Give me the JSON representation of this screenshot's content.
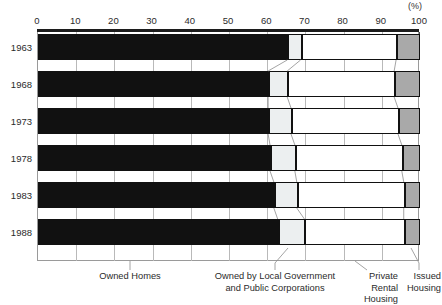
{
  "unit_note": "(%)",
  "axis": {
    "ticks": [
      "0",
      "10",
      "20",
      "30",
      "40",
      "50",
      "60",
      "70",
      "80",
      "90",
      "100"
    ],
    "min": 0,
    "max": 100
  },
  "legend": {
    "owned_homes": "Owned Homes",
    "public_line1": "Owned by Local Government",
    "public_line2": "and Public Corporations",
    "private_line1": "Private Rental",
    "private_line2": "Housing",
    "issued_line1": "Issued",
    "issued_line2": "Housing"
  },
  "years": [
    "1963",
    "1968",
    "1973",
    "1978",
    "1983",
    "1988"
  ],
  "chart_data": {
    "type": "bar",
    "orientation": "horizontal",
    "stacked": true,
    "normalized": true,
    "title": "",
    "xlabel": "",
    "ylabel": "",
    "unit": "(%)",
    "xlim": [
      0,
      100
    ],
    "grid": true,
    "legend_position": "bottom",
    "categories": [
      "1963",
      "1968",
      "1973",
      "1978",
      "1983",
      "1988"
    ],
    "tick_labels": [
      "0",
      "10",
      "20",
      "30",
      "40",
      "50",
      "60",
      "70",
      "80",
      "90",
      "100"
    ],
    "series": [
      {
        "name": "Owned Homes",
        "color": "#111111",
        "values": [
          65.5,
          60.5,
          60.5,
          61.0,
          62.0,
          63.0
        ]
      },
      {
        "name": "Owned by Local Government and Public Corporations",
        "color": "#eceff0",
        "values": [
          3.5,
          5.0,
          6.0,
          6.5,
          6.0,
          7.0
        ]
      },
      {
        "name": "Private Rental Housing",
        "color": "#ffffff",
        "values": [
          25.0,
          28.0,
          28.0,
          28.0,
          28.0,
          26.0
        ]
      },
      {
        "name": "Issued Housing",
        "color": "#a9a9a9",
        "values": [
          6.0,
          6.5,
          5.5,
          4.5,
          4.0,
          4.0
        ]
      }
    ],
    "cumulative_boundaries": [
      [
        65.5,
        69.0,
        94.0,
        100
      ],
      [
        60.5,
        65.5,
        93.5,
        100
      ],
      [
        60.5,
        66.5,
        94.5,
        100
      ],
      [
        61.0,
        67.5,
        95.5,
        100
      ],
      [
        62.0,
        68.0,
        96.0,
        100
      ],
      [
        63.0,
        70.0,
        96.0,
        100
      ]
    ]
  }
}
